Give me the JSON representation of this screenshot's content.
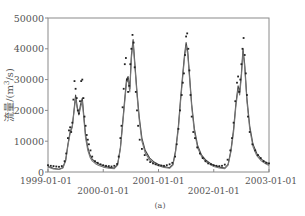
{
  "chart_data": {
    "type": "line",
    "title": "",
    "caption": "(a)",
    "xlabel": "",
    "ylabel": "流量/(m³/s)",
    "ylabel_parts": {
      "prefix": "流量/(m",
      "sup": "3",
      "suffix": "/s)"
    },
    "ylim": [
      0,
      50000
    ],
    "xlim": [
      "1999-01-01",
      "2003-01-01"
    ],
    "grid": false,
    "legend": null,
    "y_ticks": [
      0,
      10000,
      20000,
      30000,
      40000,
      50000
    ],
    "y_tick_labels": [
      "0",
      "10000",
      "20000",
      "30000",
      "40000",
      "50000"
    ],
    "x_ticks": [
      "1999-01-01",
      "2000-01-01",
      "2001-01-01",
      "2002-01-01",
      "2003-01-01"
    ],
    "x_tick_labels": [
      "1999-01-01",
      "2000-01-01",
      "2001-01-01",
      "2002-01-01",
      "2003-01-01"
    ],
    "x_unit": "years since 1999-01-01",
    "series": [
      {
        "name": "Observed",
        "style": "scatter",
        "color": "#222222",
        "x": [
          0.0,
          0.05,
          0.1,
          0.15,
          0.2,
          0.25,
          0.3,
          0.33,
          0.36,
          0.38,
          0.4,
          0.42,
          0.44,
          0.46,
          0.48,
          0.5,
          0.52,
          0.54,
          0.56,
          0.58,
          0.6,
          0.62,
          0.64,
          0.66,
          0.68,
          0.7,
          0.72,
          0.74,
          0.77,
          0.8,
          0.85,
          0.9,
          0.95,
          1.0,
          1.05,
          1.1,
          1.15,
          1.2,
          1.25,
          1.28,
          1.31,
          1.33,
          1.35,
          1.37,
          1.39,
          1.41,
          1.43,
          1.45,
          1.47,
          1.49,
          1.51,
          1.53,
          1.55,
          1.57,
          1.59,
          1.61,
          1.63,
          1.66,
          1.7,
          1.75,
          1.8,
          1.85,
          1.9,
          1.95,
          2.0,
          2.05,
          2.1,
          2.15,
          2.2,
          2.25,
          2.3,
          2.33,
          2.36,
          2.39,
          2.42,
          2.44,
          2.46,
          2.48,
          2.5,
          2.52,
          2.54,
          2.56,
          2.58,
          2.6,
          2.63,
          2.66,
          2.7,
          2.75,
          2.8,
          2.85,
          2.9,
          2.95,
          3.0,
          3.05,
          3.1,
          3.15,
          3.2,
          3.25,
          3.3,
          3.33,
          3.36,
          3.39,
          3.42,
          3.44,
          3.46,
          3.48,
          3.5,
          3.52,
          3.54,
          3.56,
          3.58,
          3.6,
          3.62,
          3.65,
          3.7,
          3.75,
          3.8,
          3.85,
          3.9,
          3.95,
          4.0
        ],
        "values": [
          2200,
          2000,
          1900,
          1800,
          1700,
          1900,
          3500,
          6000,
          11000,
          13500,
          14500,
          13000,
          16000,
          23500,
          29500,
          27000,
          24000,
          20000,
          19000,
          23000,
          29500,
          30000,
          24000,
          18000,
          15000,
          12000,
          10500,
          9000,
          7000,
          5000,
          3500,
          3000,
          2500,
          2200,
          2000,
          1900,
          1800,
          2000,
          2600,
          5000,
          11000,
          15000,
          21000,
          27000,
          35000,
          37000,
          30000,
          26000,
          28000,
          35000,
          40000,
          44500,
          42000,
          34000,
          26000,
          20000,
          15000,
          10500,
          7500,
          5500,
          4000,
          3200,
          2800,
          2500,
          2200,
          2100,
          2000,
          2200,
          2500,
          3000,
          5000,
          9000,
          14000,
          20000,
          25000,
          29000,
          32000,
          38000,
          44000,
          45000,
          40000,
          33000,
          25000,
          18000,
          13000,
          11000,
          8000,
          6000,
          4500,
          3500,
          2800,
          2500,
          2200,
          2000,
          1900,
          2000,
          2400,
          4000,
          7000,
          11000,
          16000,
          23000,
          29000,
          31000,
          26000,
          30000,
          35000,
          40000,
          43500,
          38000,
          32000,
          25000,
          18000,
          13000,
          9000,
          7000,
          5500,
          4500,
          3500,
          3000,
          2800
        ]
      },
      {
        "name": "Simulated 1",
        "style": "line",
        "color": "#444444",
        "x": [
          0.0,
          0.1,
          0.2,
          0.27,
          0.32,
          0.36,
          0.4,
          0.44,
          0.47,
          0.5,
          0.53,
          0.56,
          0.59,
          0.62,
          0.65,
          0.68,
          0.72,
          0.76,
          0.8,
          0.86,
          0.92,
          1.0,
          1.1,
          1.2,
          1.26,
          1.31,
          1.35,
          1.39,
          1.42,
          1.45,
          1.48,
          1.51,
          1.54,
          1.57,
          1.61,
          1.65,
          1.7,
          1.76,
          1.84,
          1.92,
          2.0,
          2.1,
          2.2,
          2.26,
          2.31,
          2.36,
          2.4,
          2.44,
          2.47,
          2.5,
          2.53,
          2.56,
          2.6,
          2.65,
          2.71,
          2.78,
          2.86,
          2.94,
          3.0,
          3.1,
          3.2,
          3.26,
          3.31,
          3.36,
          3.4,
          3.44,
          3.47,
          3.5,
          3.53,
          3.56,
          3.6,
          3.65,
          3.71,
          3.78,
          3.86,
          3.94,
          4.0
        ],
        "values": [
          1800,
          1200,
          900,
          1500,
          4000,
          9000,
          13000,
          15000,
          20000,
          25000,
          21000,
          19000,
          22000,
          24000,
          18000,
          12000,
          8000,
          5500,
          4200,
          3200,
          2600,
          2000,
          1500,
          1300,
          2500,
          8000,
          16000,
          24000,
          30000,
          31000,
          27000,
          38000,
          43000,
          36000,
          26000,
          18000,
          11000,
          7000,
          4500,
          3200,
          2400,
          1800,
          1400,
          2500,
          7000,
          15000,
          24000,
          32000,
          38000,
          42000,
          39000,
          32000,
          22000,
          14000,
          8500,
          5500,
          3800,
          2800,
          2200,
          1600,
          1300,
          2500,
          7000,
          14000,
          22000,
          28000,
          26000,
          32000,
          40000,
          35000,
          24000,
          15000,
          9000,
          6000,
          4200,
          3200,
          2600
        ]
      },
      {
        "name": "Simulated 2",
        "style": "line",
        "color": "#777777",
        "x": [
          0.0,
          0.1,
          0.2,
          0.27,
          0.32,
          0.36,
          0.4,
          0.44,
          0.47,
          0.5,
          0.53,
          0.56,
          0.59,
          0.62,
          0.65,
          0.68,
          0.72,
          0.76,
          0.8,
          0.86,
          0.92,
          1.0,
          1.1,
          1.2,
          1.26,
          1.31,
          1.35,
          1.39,
          1.42,
          1.45,
          1.48,
          1.51,
          1.54,
          1.57,
          1.61,
          1.65,
          1.7,
          1.76,
          1.84,
          1.92,
          2.0,
          2.1,
          2.2,
          2.26,
          2.31,
          2.36,
          2.4,
          2.44,
          2.47,
          2.5,
          2.53,
          2.56,
          2.6,
          2.65,
          2.71,
          2.78,
          2.86,
          2.94,
          3.0,
          3.1,
          3.2,
          3.26,
          3.31,
          3.36,
          3.4,
          3.44,
          3.47,
          3.5,
          3.53,
          3.56,
          3.6,
          3.65,
          3.71,
          3.78,
          3.86,
          3.94,
          4.0
        ],
        "values": [
          1600,
          1000,
          800,
          1300,
          3600,
          8500,
          12500,
          14500,
          19500,
          24000,
          20500,
          18500,
          21000,
          23000,
          17000,
          11000,
          7000,
          4800,
          3600,
          2700,
          2100,
          1600,
          1200,
          1100,
          2200,
          7500,
          15000,
          23000,
          29000,
          30000,
          26000,
          37000,
          42000,
          35000,
          25000,
          17000,
          10000,
          6200,
          3900,
          2700,
          2000,
          1500,
          1200,
          2200,
          6500,
          14000,
          23000,
          31000,
          37000,
          41000,
          38000,
          31000,
          21000,
          13000,
          7800,
          5000,
          3300,
          2400,
          1800,
          1300,
          1100,
          2200,
          6500,
          13000,
          21000,
          27000,
          25000,
          31000,
          39000,
          34000,
          23000,
          14000,
          8200,
          5300,
          3600,
          2700,
          2100
        ]
      }
    ]
  }
}
